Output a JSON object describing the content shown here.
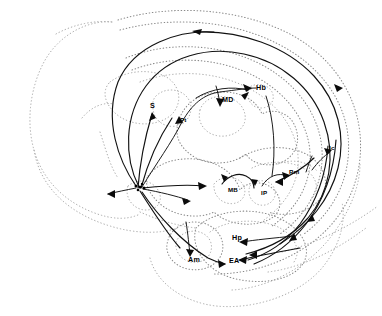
{
  "figure": {
    "kind": "neuroanatomical-circuit-diagram",
    "title": "",
    "caption": "",
    "background_color": "#ffffff",
    "outline_color": "#8a8a8a",
    "tract_color": "#111111",
    "width": 382,
    "height": 316
  },
  "labels": [
    {
      "id": "S",
      "text": "S",
      "x": 150,
      "y": 108,
      "size": "normal"
    },
    {
      "id": "Pt",
      "text": "Pt",
      "x": 180,
      "y": 122,
      "size": "small"
    },
    {
      "id": "MD",
      "text": "MD",
      "x": 222,
      "y": 102,
      "size": "normal"
    },
    {
      "id": "Hb",
      "text": "Hb",
      "x": 256,
      "y": 90,
      "size": "normal"
    },
    {
      "id": "lc",
      "text": "lc",
      "x": 329,
      "y": 150,
      "size": "small"
    },
    {
      "id": "Rm",
      "text": "Rm",
      "x": 289,
      "y": 174,
      "size": "small"
    },
    {
      "id": "MB",
      "text": "MB",
      "x": 228,
      "y": 192,
      "size": "small"
    },
    {
      "id": "IP",
      "text": "IP",
      "x": 261,
      "y": 195,
      "size": "small"
    },
    {
      "id": "Hp",
      "text": "Hp",
      "x": 232,
      "y": 240,
      "size": "normal"
    },
    {
      "id": "Am",
      "text": "Am",
      "x": 188,
      "y": 262,
      "size": "normal"
    },
    {
      "id": "EA",
      "text": "EA",
      "x": 229,
      "y": 263,
      "size": "normal"
    }
  ],
  "structures": [
    {
      "id": "md",
      "name": "mediodorsal-thalamic-nucleus",
      "abbr": "MD"
    },
    {
      "id": "hb",
      "name": "habenula",
      "abbr": "Hb"
    },
    {
      "id": "s",
      "name": "septum",
      "abbr": "S"
    },
    {
      "id": "pt",
      "name": "paratenial-nucleus",
      "abbr": "Pt"
    },
    {
      "id": "lc",
      "name": "locus-coeruleus",
      "abbr": "lc"
    },
    {
      "id": "rm",
      "name": "raphe-magnus",
      "abbr": "Rm"
    },
    {
      "id": "mb",
      "name": "mammillary-body",
      "abbr": "MB"
    },
    {
      "id": "ip",
      "name": "interpeduncular-nucleus",
      "abbr": "IP"
    },
    {
      "id": "hp",
      "name": "hippocampus",
      "abbr": "Hp"
    },
    {
      "id": "am",
      "name": "amygdala",
      "abbr": "Am"
    },
    {
      "id": "ea",
      "name": "entorhinal-area",
      "abbr": "EA"
    }
  ]
}
